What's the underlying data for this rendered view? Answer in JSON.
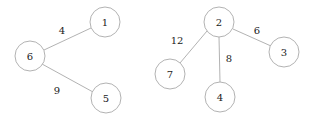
{
  "diagram": {
    "background_color": "#ffffff",
    "node_stroke_color": "#a9a9a9",
    "node_fill_color": "#ffffff",
    "edge_color": "#a9a9a9",
    "label_color": "#1a1a1a",
    "node_radius": 15,
    "components": [
      {
        "name": "left-component",
        "root": "6",
        "nodes": [
          "6",
          "1",
          "5"
        ],
        "edges": [
          {
            "from": "6",
            "to": "1",
            "weight": "4"
          },
          {
            "from": "6",
            "to": "5",
            "weight": "9"
          }
        ]
      },
      {
        "name": "right-component",
        "root": "2",
        "nodes": [
          "2",
          "7",
          "4",
          "3"
        ],
        "edges": [
          {
            "from": "2",
            "to": "7",
            "weight": "12"
          },
          {
            "from": "2",
            "to": "4",
            "weight": "8"
          },
          {
            "from": "2",
            "to": "3",
            "weight": "6"
          }
        ]
      }
    ],
    "nodes": [
      {
        "id": "n1",
        "label": "1",
        "cx": 105,
        "cy": 22
      },
      {
        "id": "n6",
        "label": "6",
        "cx": 30,
        "cy": 56
      },
      {
        "id": "n5",
        "label": "5",
        "cx": 106,
        "cy": 98
      },
      {
        "id": "n2",
        "label": "2",
        "cx": 219,
        "cy": 22
      },
      {
        "id": "n7",
        "label": "7",
        "cx": 170,
        "cy": 74
      },
      {
        "id": "n4",
        "label": "4",
        "cx": 220,
        "cy": 97
      },
      {
        "id": "n3",
        "label": "3",
        "cx": 284,
        "cy": 52
      }
    ],
    "edges": [
      {
        "id": "e-6-1",
        "label": "4",
        "x1": 44,
        "y1": 50,
        "x2": 91,
        "y2": 28,
        "lx": 62,
        "ly": 30
      },
      {
        "id": "e-6-5",
        "label": "9",
        "x1": 42,
        "y1": 64,
        "x2": 93,
        "y2": 92,
        "lx": 57,
        "ly": 90
      },
      {
        "id": "e-2-7",
        "label": "12",
        "x1": 207,
        "y1": 31,
        "x2": 180,
        "y2": 63,
        "lx": 177,
        "ly": 40
      },
      {
        "id": "e-2-4",
        "label": "8",
        "x1": 219,
        "y1": 37,
        "x2": 220,
        "y2": 82,
        "lx": 229,
        "ly": 58
      },
      {
        "id": "e-2-3",
        "label": "6",
        "x1": 233,
        "y1": 29,
        "x2": 271,
        "y2": 46,
        "lx": 257,
        "ly": 30
      }
    ]
  }
}
